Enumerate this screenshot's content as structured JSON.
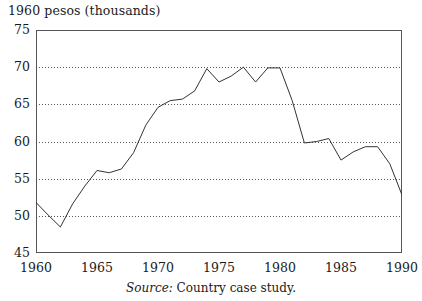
{
  "figure": {
    "y_axis_title": "1960 pesos (thousands)",
    "source_label": "Source:",
    "source_text": " Country case study."
  },
  "chart_data": {
    "type": "line",
    "title": "",
    "subtitle": "",
    "xlabel": "",
    "ylabel": "1960 pesos (thousands)",
    "xlim": [
      1960,
      1990
    ],
    "ylim": [
      45,
      75
    ],
    "y_ticks": [
      45,
      50,
      55,
      60,
      65,
      70,
      75
    ],
    "y_tick_labels": [
      "45",
      "50",
      "55",
      "60",
      "65",
      "70",
      "75"
    ],
    "x_ticks": [
      1960,
      1965,
      1970,
      1975,
      1980,
      1985,
      1990
    ],
    "x_tick_labels": [
      "1960",
      "1965",
      "1970",
      "1975",
      "1980",
      "1985",
      "1990"
    ],
    "x_minor_ticks": [
      1960,
      1961,
      1962,
      1963,
      1964,
      1965,
      1966,
      1967,
      1968,
      1969,
      1970,
      1971,
      1972,
      1973,
      1974,
      1975,
      1976,
      1977,
      1978,
      1979,
      1980,
      1981,
      1982,
      1983,
      1984,
      1985,
      1986,
      1987,
      1988,
      1989,
      1990
    ],
    "grid": "horizontal-dotted",
    "gridlines": [
      50,
      55,
      60,
      65,
      70
    ],
    "legend": "none",
    "line_color": "#333333",
    "x": [
      1960,
      1961,
      1962,
      1963,
      1964,
      1965,
      1966,
      1967,
      1968,
      1969,
      1970,
      1971,
      1972,
      1973,
      1974,
      1975,
      1976,
      1977,
      1978,
      1979,
      1980,
      1981,
      1982,
      1983,
      1984,
      1985,
      1986,
      1987,
      1988,
      1989,
      1990
    ],
    "values": [
      51.8,
      50.1,
      48.5,
      51.6,
      54.0,
      56.1,
      55.8,
      56.3,
      58.5,
      62.2,
      64.6,
      65.5,
      65.7,
      66.8,
      69.8,
      68.0,
      68.8,
      70.0,
      68.0,
      69.9,
      69.9,
      65.5,
      59.8,
      60.0,
      60.4,
      57.5,
      58.6,
      59.3,
      59.3,
      57.0,
      52.8
    ],
    "series": [
      {
        "name": "1960 pesos (thousands)",
        "values": [
          51.8,
          50.1,
          48.5,
          51.6,
          54.0,
          56.1,
          55.8,
          56.3,
          58.5,
          62.2,
          64.6,
          65.5,
          65.7,
          66.8,
          69.8,
          68.0,
          68.8,
          70.0,
          68.0,
          69.9,
          69.9,
          65.5,
          59.8,
          60.0,
          60.4,
          57.5,
          58.6,
          59.3,
          59.3,
          57.0,
          52.8
        ]
      }
    ]
  }
}
